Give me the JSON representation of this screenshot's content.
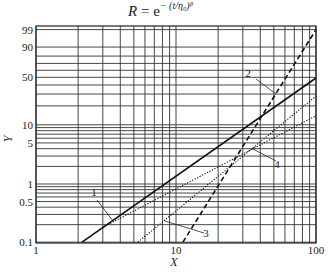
{
  "title": {
    "lhs": "R",
    "eq": " = e",
    "exponent": "− (t/η₀)ᵝ"
  },
  "chart_data": {
    "type": "line",
    "xlabel": "X",
    "ylabel": "Y",
    "xscale": "log",
    "yscale": "weibull-probability (%)",
    "xlim": [
      1,
      100
    ],
    "ylim": [
      0.1,
      99
    ],
    "grid": true,
    "x_tick_labels": [
      "1",
      "10",
      "100"
    ],
    "x_ticks": [
      1,
      10,
      100
    ],
    "y_tick_labels": [
      "0.1",
      "0.5",
      "1",
      "5",
      "10",
      "50",
      "90",
      "99"
    ],
    "y_ticks": [
      0.1,
      0.5,
      1,
      5,
      10,
      50,
      90,
      99
    ],
    "x_grid": [
      1,
      2,
      3,
      4,
      5,
      6,
      7,
      8,
      9,
      10,
      20,
      30,
      40,
      50,
      60,
      70,
      80,
      90,
      100
    ],
    "y_grid": [
      0.1,
      0.2,
      0.3,
      0.4,
      0.5,
      0.6,
      0.7,
      0.8,
      0.9,
      1,
      2,
      3,
      4,
      5,
      6,
      7,
      8,
      9,
      10,
      20,
      30,
      40,
      50,
      60,
      70,
      80,
      90,
      99
    ],
    "series": [
      {
        "name": "1",
        "style": "solid",
        "x": [
          2.13,
          100
        ],
        "y": [
          0.1,
          49
        ]
      },
      {
        "name": "2",
        "style": "dashed",
        "x": [
          11.2,
          100
        ],
        "y": [
          0.1,
          99
        ]
      },
      {
        "name": "3",
        "style": "dotted",
        "x": [
          5.35,
          100
        ],
        "y": [
          0.1,
          28
        ]
      },
      {
        "name": "4",
        "style": "dotted",
        "x": [
          3.0,
          100
        ],
        "y": [
          0.18,
          14
        ]
      }
    ],
    "annotations": [
      {
        "text": "1",
        "label_at": [
          94,
          196
        ],
        "leader": [
          [
            97,
            200
          ],
          [
            113,
            221
          ]
        ]
      },
      {
        "text": "2",
        "label_at": [
          248,
          77
        ],
        "leader": [
          [
            256,
            79
          ],
          [
            276,
            94
          ]
        ]
      },
      {
        "text": "3",
        "label_at": [
          206,
          237
        ],
        "leader": [
          [
            204,
            233
          ],
          [
            165,
            221
          ]
        ]
      },
      {
        "text": "4",
        "label_at": [
          277,
          168
        ],
        "leader": [
          [
            276,
            161
          ],
          [
            253,
            149
          ]
        ]
      }
    ]
  }
}
